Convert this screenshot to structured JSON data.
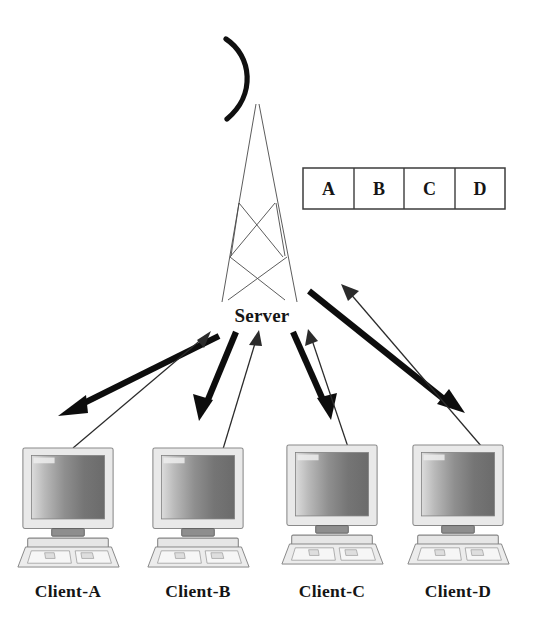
{
  "diagram": {
    "background_color": "#ffffff",
    "width": 545,
    "height": 630
  },
  "server": {
    "label": "Server",
    "icon": "antenna-tower-with-dish",
    "label_x": 262,
    "label_y": 322
  },
  "packet_table": {
    "cells": [
      {
        "label": "A"
      },
      {
        "label": "B"
      },
      {
        "label": "C"
      },
      {
        "label": "D"
      }
    ],
    "x": 303,
    "y": 168,
    "width": 202,
    "height": 41,
    "border_color": "#3c3c3c",
    "fill_color": "#ffffff"
  },
  "clients": [
    {
      "label": "Client-A",
      "icon": "desktop-computer-icon",
      "center_x": 68,
      "label_y": 597,
      "downlink": {
        "from": [
          218,
          337
        ],
        "to": [
          62,
          414
        ],
        "style": "thick"
      },
      "uplink": {
        "from": [
          72,
          447
        ],
        "to": [
          209,
          331
        ],
        "style": "thin"
      }
    },
    {
      "label": "Client-B",
      "icon": "desktop-computer-icon",
      "center_x": 198,
      "label_y": 597,
      "downlink": {
        "from": [
          237,
          332
        ],
        "to": [
          200,
          419
        ],
        "style": "thick"
      },
      "uplink": {
        "from": [
          222,
          448
        ],
        "to": [
          261,
          331
        ],
        "style": "thin"
      }
    },
    {
      "label": "Client-C",
      "icon": "desktop-computer-icon",
      "center_x": 332,
      "label_y": 597,
      "downlink": {
        "from": [
          292,
          332
        ],
        "to": [
          330,
          418
        ],
        "style": "thick"
      },
      "uplink": {
        "from": [
          348,
          450
        ],
        "to": [
          306,
          329
        ],
        "style": "thin"
      }
    },
    {
      "label": "Client-D",
      "icon": "desktop-computer-icon",
      "center_x": 458,
      "label_y": 597,
      "downlink": {
        "from": [
          307,
          290
        ],
        "to": [
          463,
          412
        ],
        "style": "thick"
      },
      "uplink": {
        "from": [
          480,
          447
        ],
        "to": [
          338,
          285
        ],
        "style": "thin"
      }
    }
  ],
  "legend": {
    "thick_arrow_meaning": "server-to-client downlink",
    "thin_arrow_meaning": "client-to-server uplink"
  },
  "colors": {
    "ink": "#151515",
    "thick_arrow": "#0d0d0d",
    "thin_arrow": "#2b2b2b",
    "tower_line": "#4a4a4a",
    "screen_light": "#d6d6d6",
    "screen_dark": "#6f6f6f",
    "chassis": "#e9e9e9"
  }
}
